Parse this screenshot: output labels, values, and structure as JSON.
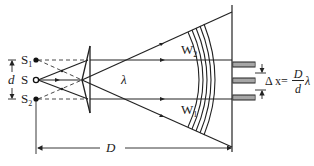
{
  "diagram": {
    "labels": {
      "source_s1": "S",
      "source_s1_sub": "1",
      "source_s": "S",
      "source_s2": "S",
      "source_s2_sub": "2",
      "separation": "d",
      "wavelength": "λ",
      "wavefront_w2": "W",
      "wavefront_w2_sub": "2",
      "wavefront_w1": "W",
      "wavefront_w1_sub": "1",
      "distance": "D",
      "formula_lhs": "Δ x=",
      "formula_num": "D",
      "formula_den": "d",
      "formula_rhs": "λ"
    },
    "components": [
      "point source S",
      "virtual sources S1 and S2",
      "biprism",
      "wavefronts W1 and W2",
      "screen",
      "interference fringes"
    ],
    "colors": {
      "ink": "#222222",
      "background": "#ffffff"
    }
  }
}
